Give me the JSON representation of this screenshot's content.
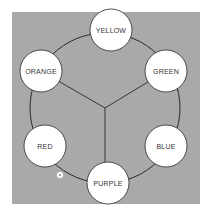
{
  "diagram": {
    "background_color": "#a9a9a9",
    "node_fill": "#ffffff",
    "line_color": "#2a2a2a",
    "nodes": [
      {
        "id": "yellow",
        "label": "YELLOW",
        "cx": 111,
        "cy": 30
      },
      {
        "id": "green",
        "label": "GREEN",
        "cx": 166,
        "cy": 71
      },
      {
        "id": "blue",
        "label": "BLUE",
        "cx": 166,
        "cy": 146
      },
      {
        "id": "purple",
        "label": "PURPLE",
        "cx": 108,
        "cy": 183
      },
      {
        "id": "red",
        "label": "RED",
        "cx": 45,
        "cy": 146
      },
      {
        "id": "orange",
        "label": "ORANGE",
        "cx": 41,
        "cy": 71
      }
    ],
    "center": {
      "cx": 105,
      "cy": 108
    },
    "spokes_to": [
      "orange",
      "green",
      "purple"
    ],
    "marker": {
      "cx": 60,
      "cy": 175
    }
  }
}
